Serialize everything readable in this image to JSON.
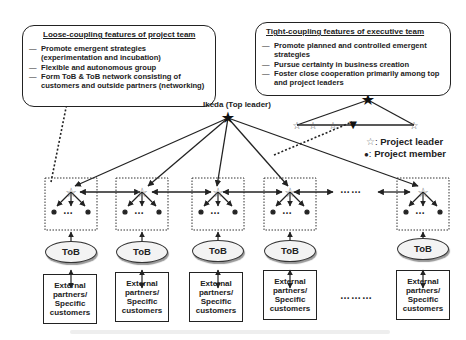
{
  "loose_box": {
    "title": "Loose-coupling features of project team",
    "items": [
      "Promote emergent strategies (experimentation and incubation)",
      "Flexible and autonomous group",
      "Form ToB & ToB network consisting of customers and outside partners (networking)"
    ]
  },
  "tight_box": {
    "title": "Tight-coupling features of executive team",
    "items": [
      "Promote planned and controlled emergent strategies",
      "Pursue certainty in business creation",
      "Foster close cooperation primarily among top and project leaders"
    ]
  },
  "top_leader": {
    "label": "Ikeda (Top leader)"
  },
  "legend": {
    "leader_symbol": "☆",
    "leader_label": "Project leader",
    "member_symbol": "●",
    "member_label": "Project member"
  },
  "teams": [
    {
      "tob": "ToB",
      "external": "External partners/ Specific customers"
    },
    {
      "tob": "ToB",
      "external": "External partners/ Specific customers"
    },
    {
      "tob": "ToB",
      "external": "External partners/ Specific customers"
    },
    {
      "tob": "ToB",
      "external": "External partners/ Specific customers"
    },
    {
      "tob": "ToB",
      "external": "External partners/ Specific customers"
    }
  ],
  "ellipsis": {
    "team_row": "……",
    "customer_row": "………",
    "member": "…"
  },
  "colors": {
    "line": "#222222",
    "box_fill": "#ffffff",
    "tob_fill": "#f3f3f3"
  }
}
